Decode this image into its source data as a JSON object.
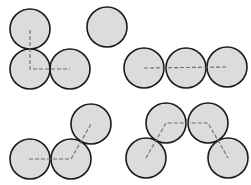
{
  "diagram": {
    "colors": {
      "circle_fill": "#dcdcdc",
      "circle_stroke": "#1a1a1a",
      "dashed_line": "#6e6e6e",
      "background": "#ffffff"
    },
    "radius": 20,
    "groups": [
      {
        "name": "L-shaped-trio",
        "circles": [
          [
            30,
            29
          ],
          [
            30,
            69
          ],
          [
            70,
            69
          ]
        ],
        "path": [
          [
            30,
            30
          ],
          [
            30,
            69
          ],
          [
            70,
            69
          ]
        ]
      },
      {
        "name": "single-circle",
        "circles": [
          [
            107,
            27
          ]
        ],
        "path": []
      },
      {
        "name": "straight-row-of-three",
        "circles": [
          [
            144,
            68
          ],
          [
            186,
            68
          ],
          [
            227,
            67
          ]
        ],
        "path": [
          [
            144,
            68
          ],
          [
            227,
            67
          ]
        ]
      },
      {
        "name": "bent-trio",
        "circles": [
          [
            30,
            159
          ],
          [
            71,
            159
          ],
          [
            91,
            124
          ]
        ],
        "path": [
          [
            29,
            159
          ],
          [
            71,
            159
          ],
          [
            91,
            124
          ]
        ]
      },
      {
        "name": "arch-of-four",
        "circles": [
          [
            146,
            158
          ],
          [
            166,
            123
          ],
          [
            208,
            123
          ],
          [
            228,
            158
          ]
        ],
        "path": [
          [
            146,
            158
          ],
          [
            166,
            123
          ],
          [
            208,
            123
          ],
          [
            228,
            158
          ]
        ]
      }
    ]
  }
}
